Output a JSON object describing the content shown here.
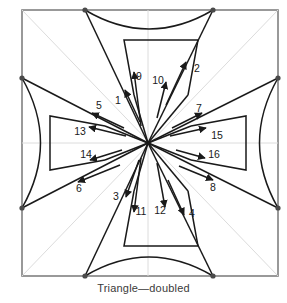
{
  "figure": {
    "caption": "Triangle—doubled",
    "type": "crease-pattern-folding-diagram",
    "colors": {
      "stroke_dark": "#1a1a1a",
      "stroke_frame": "#808080",
      "stroke_grid": "#d9d9d9",
      "vertex_dot": "#4a4a4a",
      "background": "#ffffff",
      "caption_text": "#3a3a3a"
    },
    "frame": {
      "left": 22,
      "top": 10,
      "right": 278,
      "bottom": 276
    },
    "center": {
      "x": 148,
      "y": 143
    },
    "edge_points": [
      {
        "name": "top-left-node",
        "x": 85,
        "y": 10
      },
      {
        "name": "top-right-node",
        "x": 213,
        "y": 10
      },
      {
        "name": "right-top-node",
        "x": 278,
        "y": 78
      },
      {
        "name": "right-bottom-node",
        "x": 278,
        "y": 208
      },
      {
        "name": "bottom-right-node",
        "x": 213,
        "y": 276
      },
      {
        "name": "bottom-left-node",
        "x": 85,
        "y": 276
      },
      {
        "name": "left-bottom-node",
        "x": 22,
        "y": 208
      },
      {
        "name": "left-top-node",
        "x": 22,
        "y": 78
      }
    ],
    "arrow_labels": [
      {
        "id": "1",
        "x": 118,
        "y": 100,
        "anchor": "middle"
      },
      {
        "id": "2",
        "x": 196,
        "y": 68,
        "anchor": "middle"
      },
      {
        "id": "3",
        "x": 116,
        "y": 196,
        "anchor": "middle"
      },
      {
        "id": "4",
        "x": 190,
        "y": 213,
        "anchor": "middle"
      },
      {
        "id": "5",
        "x": 98,
        "y": 105,
        "anchor": "middle"
      },
      {
        "id": "6",
        "x": 80,
        "y": 188,
        "anchor": "middle"
      },
      {
        "id": "7",
        "x": 200,
        "y": 108,
        "anchor": "middle"
      },
      {
        "id": "8",
        "x": 213,
        "y": 187,
        "anchor": "middle"
      },
      {
        "id": "9",
        "x": 138,
        "y": 76,
        "anchor": "middle"
      },
      {
        "id": "10",
        "x": 158,
        "y": 80,
        "anchor": "middle"
      },
      {
        "id": "11",
        "x": 140,
        "y": 211,
        "anchor": "middle"
      },
      {
        "id": "12",
        "x": 159,
        "y": 210,
        "anchor": "middle"
      },
      {
        "id": "13",
        "x": 80,
        "y": 131,
        "anchor": "middle"
      },
      {
        "id": "14",
        "x": 86,
        "y": 154,
        "anchor": "middle"
      },
      {
        "id": "15",
        "x": 216,
        "y": 135,
        "anchor": "middle"
      },
      {
        "id": "16",
        "x": 213,
        "y": 154,
        "anchor": "middle"
      }
    ],
    "inner_trapezoids": [
      {
        "name": "top-trapezoid",
        "points": "124,40 198,40 188,95 134,95"
      },
      {
        "name": "bottom-trapezoid",
        "points": "134,191 188,191 198,246 124,246"
      },
      {
        "name": "left-trapezoid",
        "points": "50,116 50,170 105,160 105,126"
      },
      {
        "name": "right-trapezoid",
        "points": "246,116 246,170 191,160 191,126"
      }
    ]
  }
}
